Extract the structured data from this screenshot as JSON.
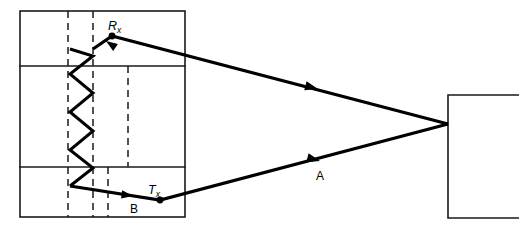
{
  "figure": {
    "canvas": {
      "width": 519,
      "height": 233,
      "background": "#ffffff"
    },
    "ink_color": "#000000",
    "structure_color": "#1a1a1a"
  },
  "building_left": {
    "name": "left-building-outline",
    "x": 20,
    "y": 11,
    "width": 165,
    "height": 206,
    "floor_dividers_y": [
      66,
      167
    ]
  },
  "building_right": {
    "name": "right-building-outline",
    "x": 448,
    "y": 95,
    "width": 71,
    "height": 123
  },
  "dashed_guides": [
    {
      "name": "dashed-guide-left",
      "x": 68,
      "y1": 11,
      "y2": 217
    },
    {
      "name": "dashed-guide-inner",
      "x": 93,
      "y1": 11,
      "y2": 217
    },
    {
      "name": "dashed-guide-middle",
      "x": 128,
      "y1": 66,
      "y2": 167
    },
    {
      "name": "dashed-guide-lower",
      "x": 108,
      "y1": 167,
      "y2": 217
    }
  ],
  "zigzag": {
    "name": "multipath-zigzag",
    "points": "70,186 93,168 70,150 93,131 70,112 93,93 70,74 93,56 70,49"
  },
  "rays": {
    "upper": {
      "name": "upper-ray-path",
      "points": "93,49 112,36 448,124",
      "arrow": {
        "x": 318,
        "y": 89,
        "angle": 194.6
      },
      "incoming_arrow": {
        "x": 104,
        "y": 42,
        "angle": 214
      }
    },
    "lower": {
      "name": "lower-ray-path",
      "points": "70,186 160,200 448,124",
      "arrow": {
        "x": 320,
        "y": 161,
        "angle": 194.8
      },
      "incoming_arrow": {
        "x": 133,
        "y": 196,
        "angle": 188
      }
    }
  },
  "nodes": [
    {
      "name": "node-rx",
      "x": 112,
      "y": 36,
      "r": 3.4
    },
    {
      "name": "node-tx",
      "x": 160,
      "y": 200,
      "r": 3.4
    }
  ],
  "labels": {
    "rx": {
      "text": "R",
      "sub": "x",
      "x": 108,
      "y": 30,
      "name": "label-rx"
    },
    "tx": {
      "text": "T",
      "sub": "x",
      "x": 148,
      "y": 194,
      "name": "label-tx"
    },
    "point_a": {
      "text": "A",
      "x": 316,
      "y": 180,
      "name": "label-point-a"
    },
    "point_b": {
      "text": "B",
      "x": 130,
      "y": 213,
      "name": "label-point-b"
    }
  }
}
